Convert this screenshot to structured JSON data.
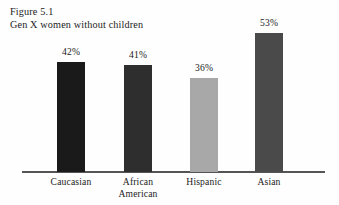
{
  "figure": {
    "number_label": "Figure 5.1",
    "title": "Gen X women without children"
  },
  "chart_data": {
    "type": "bar",
    "title": "Gen X women without children",
    "subtitle": "Figure 5.1",
    "xlabel": "",
    "ylabel": "",
    "ylim": [
      0,
      60
    ],
    "grid": false,
    "legend": "none",
    "categories": [
      "Caucasian",
      "African American",
      "Hispanic",
      "Asian"
    ],
    "values": [
      42,
      41,
      36,
      53
    ],
    "value_labels": [
      "42%",
      "41%",
      "36%",
      "53%"
    ],
    "bar_colors": [
      "#1a1a1a",
      "#2e2e2e",
      "#a8a8a8",
      "#4a4a4a"
    ],
    "axis_color": "#555555",
    "background_color": "#fefefe",
    "series": [
      {
        "name": "Gen X women without children",
        "values": [
          42,
          41,
          36,
          53
        ]
      }
    ],
    "points": [
      {
        "category": "Caucasian",
        "label_lines": [
          "Caucasian"
        ],
        "value": 42,
        "value_label": "42%",
        "color": "#1a1a1a"
      },
      {
        "category": "African American",
        "label_lines": [
          "African",
          "American"
        ],
        "value": 41,
        "value_label": "41%",
        "color": "#2e2e2e"
      },
      {
        "category": "Hispanic",
        "label_lines": [
          "Hispanic"
        ],
        "value": 36,
        "value_label": "36%",
        "color": "#a8a8a8"
      },
      {
        "category": "Asian",
        "label_lines": [
          "Asian"
        ],
        "value": 53,
        "value_label": "53%",
        "color": "#4a4a4a"
      }
    ]
  }
}
